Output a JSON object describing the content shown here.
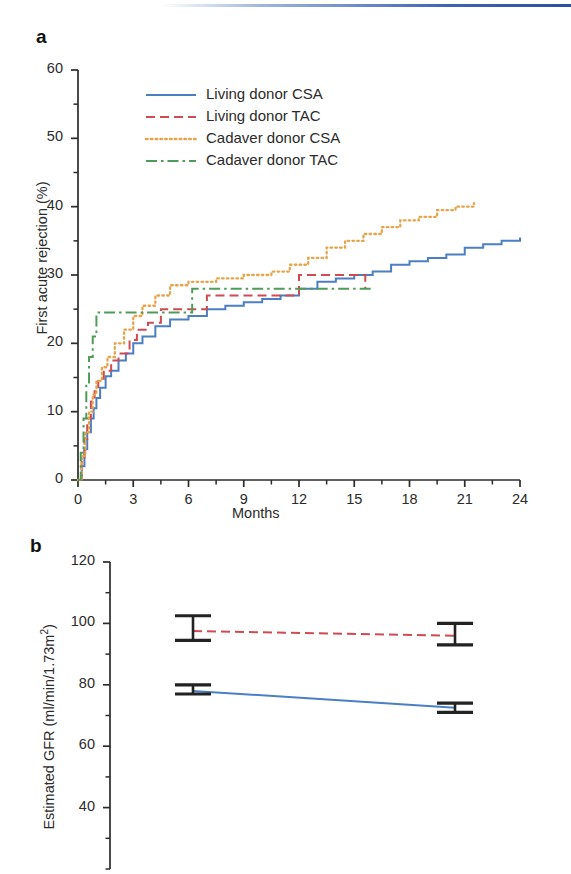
{
  "figure": {
    "panel_a_letter": "a",
    "panel_b_letter": "b"
  },
  "chart_data": [
    {
      "id": "panel_a",
      "type": "line",
      "title": "",
      "xlabel": "Months",
      "ylabel": "First acute rejection (%)",
      "xlim": [
        0,
        24
      ],
      "ylim": [
        0,
        60
      ],
      "xticks": [
        0,
        3,
        6,
        9,
        12,
        15,
        18,
        21,
        24
      ],
      "xtick_labels": [
        "0",
        "3",
        "6",
        "9",
        "12",
        "15",
        "18",
        "21",
        "24"
      ],
      "yticks": [
        0,
        10,
        20,
        30,
        40,
        50,
        60
      ],
      "ytick_labels": [
        "0",
        "10",
        "20",
        "30",
        "40",
        "50",
        "60"
      ],
      "minor_xtick_interval": 1.5,
      "minor_ytick_interval": 5,
      "grid": false,
      "legend_position": "upper-left-inside",
      "step_style": "post",
      "series": [
        {
          "name": "Living donor CSA",
          "color": "#4b7fc4",
          "dash": "solid",
          "points": [
            [
              0,
              0
            ],
            [
              0.2,
              2.0
            ],
            [
              0.35,
              4.5
            ],
            [
              0.5,
              7.0
            ],
            [
              0.7,
              9.0
            ],
            [
              0.85,
              10.5
            ],
            [
              1.0,
              12.0
            ],
            [
              1.2,
              13.5
            ],
            [
              1.5,
              15.2
            ],
            [
              1.8,
              16.0
            ],
            [
              2.2,
              17.5
            ],
            [
              2.6,
              18.5
            ],
            [
              3.0,
              20.0
            ],
            [
              3.5,
              21.0
            ],
            [
              4.2,
              22.5
            ],
            [
              5.0,
              23.5
            ],
            [
              6.0,
              24.0
            ],
            [
              7.0,
              25.0
            ],
            [
              8.0,
              25.5
            ],
            [
              9.0,
              26.0
            ],
            [
              10.0,
              26.5
            ],
            [
              11.0,
              27.0
            ],
            [
              12.0,
              28.0
            ],
            [
              13.0,
              29.0
            ],
            [
              14.0,
              29.5
            ],
            [
              15.0,
              30.0
            ],
            [
              16.0,
              30.5
            ],
            [
              17.0,
              31.5
            ],
            [
              18.0,
              32.0
            ],
            [
              19.0,
              32.5
            ],
            [
              20.0,
              33.0
            ],
            [
              21.0,
              34.0
            ],
            [
              22.0,
              34.5
            ],
            [
              23.0,
              35.0
            ],
            [
              24.0,
              35.5
            ]
          ],
          "end_value": 35.5
        },
        {
          "name": "Living donor TAC",
          "color": "#cf4a52",
          "dash": "dashed",
          "points": [
            [
              0,
              0
            ],
            [
              0.2,
              3.0
            ],
            [
              0.35,
              6.0
            ],
            [
              0.5,
              9.0
            ],
            [
              0.7,
              11.5
            ],
            [
              0.9,
              13.0
            ],
            [
              1.1,
              14.5
            ],
            [
              1.4,
              16.0
            ],
            [
              1.8,
              17.5
            ],
            [
              2.2,
              18.5
            ],
            [
              2.8,
              20.5
            ],
            [
              3.2,
              22.0
            ],
            [
              3.8,
              23.0
            ],
            [
              4.5,
              25.0
            ],
            [
              6.0,
              25.0
            ],
            [
              7.0,
              27.0
            ],
            [
              9.0,
              27.0
            ],
            [
              11.5,
              27.0
            ],
            [
              12.0,
              30.0
            ],
            [
              14.5,
              30.0
            ],
            [
              15.5,
              30.0
            ],
            [
              15.6,
              28.0
            ]
          ],
          "end_value": 28.0
        },
        {
          "name": "Cadaver donor CSA",
          "color": "#e8a44a",
          "dash": "dotted",
          "points": [
            [
              0,
              0
            ],
            [
              0.2,
              3.5
            ],
            [
              0.4,
              7.0
            ],
            [
              0.6,
              10.0
            ],
            [
              0.8,
              12.5
            ],
            [
              1.0,
              14.5
            ],
            [
              1.3,
              16.5
            ],
            [
              1.6,
              18.0
            ],
            [
              2.0,
              20.0
            ],
            [
              2.5,
              22.0
            ],
            [
              3.0,
              24.0
            ],
            [
              3.5,
              25.5
            ],
            [
              4.2,
              27.0
            ],
            [
              5.0,
              28.5
            ],
            [
              6.0,
              29.0
            ],
            [
              7.5,
              29.5
            ],
            [
              9.0,
              30.0
            ],
            [
              10.5,
              30.5
            ],
            [
              11.5,
              31.5
            ],
            [
              12.5,
              32.5
            ],
            [
              13.5,
              34.0
            ],
            [
              14.5,
              35.0
            ],
            [
              15.5,
              36.0
            ],
            [
              16.5,
              37.0
            ],
            [
              17.5,
              38.0
            ],
            [
              18.5,
              38.5
            ],
            [
              19.5,
              39.5
            ],
            [
              20.5,
              40.0
            ],
            [
              21.5,
              40.5
            ]
          ],
          "end_value": 40.5
        },
        {
          "name": "Cadaver donor TAC",
          "color": "#4f9c58",
          "dash": "dashdot",
          "points": [
            [
              0,
              0
            ],
            [
              0.15,
              4.0
            ],
            [
              0.3,
              9.0
            ],
            [
              0.45,
              14.0
            ],
            [
              0.6,
              18.0
            ],
            [
              0.8,
              21.0
            ],
            [
              1.0,
              24.5
            ],
            [
              3.0,
              24.5
            ],
            [
              5.0,
              24.5
            ],
            [
              6.0,
              24.5
            ],
            [
              6.2,
              28.0
            ],
            [
              9.0,
              28.0
            ],
            [
              12.0,
              28.0
            ],
            [
              14.0,
              28.0
            ],
            [
              16.0,
              28.0
            ]
          ],
          "end_value": 28.0
        }
      ]
    },
    {
      "id": "panel_b",
      "type": "line",
      "title": "",
      "xlabel": "",
      "ylabel": "Estimated GFR (ml/min/1.73m2)",
      "ylabel_base": "Estimated GFR (ml/min/1.73m",
      "ylabel_sup": "2",
      "ylabel_tail": ")",
      "ylim": [
        20,
        120
      ],
      "yticks": [
        40,
        60,
        80,
        100,
        120
      ],
      "ytick_labels": [
        "40",
        "60",
        "80",
        "100",
        "120"
      ],
      "minor_ytick_interval": 10,
      "grid": false,
      "x_positions": [
        0,
        1
      ],
      "series": [
        {
          "name": "Living donor TAC",
          "color": "#cf4a52",
          "dash": "dashed",
          "values": [
            97.5,
            96.0
          ],
          "ci_lower": [
            94.5,
            93.0
          ],
          "ci_upper": [
            102.5,
            100.0
          ]
        },
        {
          "name": "Living donor CSA",
          "color": "#4b7fc4",
          "dash": "solid",
          "values": [
            78.0,
            72.5
          ],
          "ci_lower": [
            77.0,
            71.0
          ],
          "ci_upper": [
            80.0,
            74.0
          ]
        }
      ]
    }
  ],
  "legend": {
    "items": [
      {
        "label": "Living donor CSA",
        "color": "#4b7fc4",
        "dash": "solid"
      },
      {
        "label": "Living donor TAC",
        "color": "#cf4a52",
        "dash": "dashed"
      },
      {
        "label": "Cadaver donor CSA",
        "color": "#e8a44a",
        "dash": "dotted"
      },
      {
        "label": "Cadaver donor TAC",
        "color": "#4f9c58",
        "dash": "dashdot"
      }
    ]
  },
  "colors": {
    "living_csa": "#4b7fc4",
    "living_tac": "#cf4a52",
    "cadaver_csa": "#e8a44a",
    "cadaver_tac": "#4f9c58",
    "axis": "#2b2b2b",
    "errorbar": "#222222",
    "top_rule": "#3f63b5"
  }
}
